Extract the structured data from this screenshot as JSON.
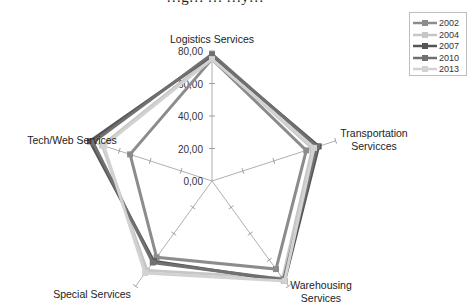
{
  "chart_data": {
    "type": "radar",
    "title": "…g… … …y…",
    "categories": [
      "Logistics Services",
      "Transportation Servicces",
      "Warehousing Services",
      "Special Services",
      "Tech/Web Services"
    ],
    "category_lines": [
      [
        "Logistics Services"
      ],
      [
        "Transportation",
        "Servicces"
      ],
      [
        "Warehousing",
        "Services"
      ],
      [
        "Special Services"
      ],
      [
        "Tech/Web Services"
      ]
    ],
    "radial_ticks": [
      "0,00",
      "20,00",
      "40,00",
      "60,00",
      "80,00"
    ],
    "rlim": [
      0,
      80
    ],
    "legend_position": "top-right",
    "series": [
      {
        "name": "2002",
        "color": "#8c8c8c",
        "values": [
          75,
          61,
          67,
          58,
          53
        ]
      },
      {
        "name": "2004",
        "color": "#c6c6c6",
        "values": [
          76,
          65,
          74,
          68,
          71
        ]
      },
      {
        "name": "2007",
        "color": "#555555",
        "values": [
          77,
          69,
          76,
          61,
          79
        ]
      },
      {
        "name": "2010",
        "color": "#707070",
        "values": [
          78,
          68,
          75,
          62,
          77
        ]
      },
      {
        "name": "2013",
        "color": "#d2d2d2",
        "values": [
          75,
          66,
          76,
          70,
          70
        ]
      }
    ]
  },
  "legend": {
    "items": [
      "2002",
      "2004",
      "2007",
      "2010",
      "2013"
    ]
  }
}
